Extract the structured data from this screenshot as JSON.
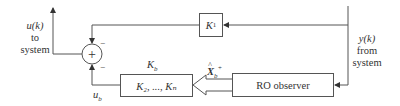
{
  "diagram": {
    "blocks": {
      "k1": {
        "label": "K",
        "sub": "1"
      },
      "kb_gain": {
        "label": "K₂, ..., Kₙ"
      },
      "observer": {
        "label": "RO observer"
      }
    },
    "labels": {
      "u_k": {
        "line1": "u(k)",
        "line2": "to",
        "line3": "system"
      },
      "y_k": {
        "line1": "y(k)",
        "line2": "from",
        "line3": "system"
      },
      "kb": "K_b",
      "kb_main": "K",
      "kb_sub": "b",
      "u_b_main": "u",
      "u_b_sub": "b",
      "x_hat_main": "X",
      "x_hat_sub": "b",
      "x_hat_sup": "+",
      "minus_top": "−",
      "minus_bottom": "−",
      "summer_symbol": "+"
    }
  }
}
